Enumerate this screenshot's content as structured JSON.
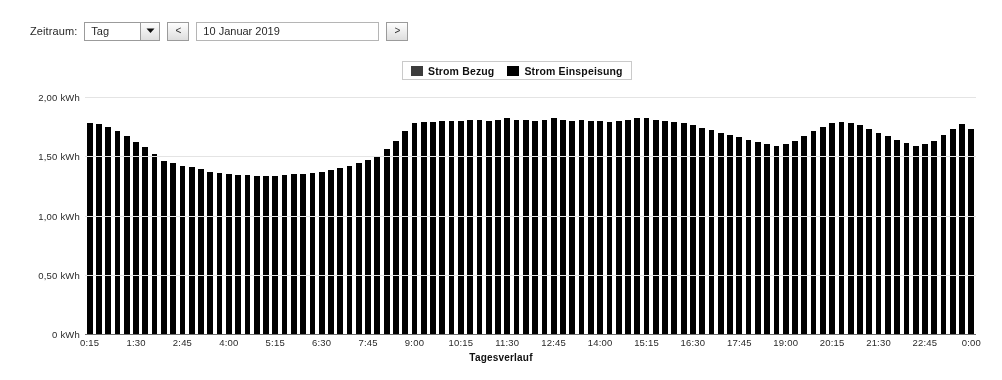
{
  "toolbar": {
    "label": "Zeitraum:",
    "period_select": {
      "value": "Tag",
      "options": [
        "Tag",
        "Woche",
        "Monat",
        "Jahr"
      ],
      "icon": "chevron-down-icon"
    },
    "prev_button": {
      "label": "<",
      "icon": "chevron-left-icon"
    },
    "date_field": {
      "value": "10 Januar 2019",
      "placeholder": ""
    },
    "next_button": {
      "label": ">",
      "icon": "chevron-right-icon"
    }
  },
  "legend": {
    "entries": [
      {
        "label": "Strom Bezug",
        "color": "#3d3d3d"
      },
      {
        "label": "Strom Einspeisung",
        "color": "#000000"
      }
    ]
  },
  "chart_data": {
    "type": "bar",
    "title": "",
    "xlabel": "Tagesverlauf",
    "ylabel": "",
    "ylim": [
      0,
      2.0
    ],
    "grid": true,
    "legend_position": "top-center",
    "ytick_labels": [
      "2,00 kWh",
      "1,50 kWh",
      "1,00 kWh",
      "0,50 kWh",
      "0 kWh"
    ],
    "ytick_values": [
      2.0,
      1.5,
      1.0,
      0.5,
      0
    ],
    "xtick_labels": [
      "0:15",
      "1:30",
      "2:45",
      "4:00",
      "5:15",
      "6:30",
      "7:45",
      "9:00",
      "10:15",
      "11:30",
      "12:45",
      "14:00",
      "15:15",
      "16:30",
      "17:45",
      "19:00",
      "20:15",
      "21:30",
      "22:45",
      "0:00"
    ],
    "xtick_indices": [
      0,
      5,
      10,
      15,
      20,
      25,
      30,
      35,
      40,
      45,
      50,
      55,
      60,
      65,
      70,
      75,
      80,
      85,
      90,
      95
    ],
    "categories": [
      "0:15",
      "0:30",
      "0:45",
      "1:00",
      "1:15",
      "1:30",
      "1:45",
      "2:00",
      "2:15",
      "2:30",
      "2:45",
      "3:00",
      "3:15",
      "3:30",
      "3:45",
      "4:00",
      "4:15",
      "4:30",
      "4:45",
      "5:00",
      "5:15",
      "5:30",
      "5:45",
      "6:00",
      "6:15",
      "6:30",
      "6:45",
      "7:00",
      "7:15",
      "7:30",
      "7:45",
      "8:00",
      "8:15",
      "8:30",
      "8:45",
      "9:00",
      "9:15",
      "9:30",
      "9:45",
      "10:00",
      "10:15",
      "10:30",
      "10:45",
      "11:00",
      "11:15",
      "11:30",
      "11:45",
      "12:00",
      "12:15",
      "12:30",
      "12:45",
      "13:00",
      "13:15",
      "13:30",
      "13:45",
      "14:00",
      "14:15",
      "14:30",
      "14:45",
      "15:00",
      "15:15",
      "15:30",
      "15:45",
      "16:00",
      "16:15",
      "16:30",
      "16:45",
      "17:00",
      "17:15",
      "17:30",
      "17:45",
      "18:00",
      "18:15",
      "18:30",
      "18:45",
      "19:00",
      "19:15",
      "19:30",
      "19:45",
      "20:00",
      "20:15",
      "20:30",
      "20:45",
      "21:00",
      "21:15",
      "21:30",
      "21:45",
      "22:00",
      "22:15",
      "22:30",
      "22:45",
      "23:00",
      "23:15",
      "23:30",
      "23:45",
      "0:00"
    ],
    "series": [
      {
        "name": "Strom Einspeisung",
        "color": "#000000",
        "values": [
          1.78,
          1.77,
          1.75,
          1.71,
          1.67,
          1.62,
          1.58,
          1.52,
          1.46,
          1.44,
          1.42,
          1.41,
          1.39,
          1.37,
          1.36,
          1.35,
          1.34,
          1.34,
          1.33,
          1.33,
          1.33,
          1.34,
          1.35,
          1.35,
          1.36,
          1.37,
          1.38,
          1.4,
          1.42,
          1.44,
          1.47,
          1.5,
          1.56,
          1.63,
          1.71,
          1.78,
          1.79,
          1.79,
          1.8,
          1.8,
          1.8,
          1.81,
          1.81,
          1.8,
          1.81,
          1.82,
          1.81,
          1.81,
          1.8,
          1.81,
          1.82,
          1.81,
          1.8,
          1.81,
          1.8,
          1.8,
          1.79,
          1.8,
          1.81,
          1.82,
          1.82,
          1.81,
          1.8,
          1.79,
          1.78,
          1.76,
          1.74,
          1.72,
          1.7,
          1.68,
          1.66,
          1.64,
          1.62,
          1.6,
          1.59,
          1.6,
          1.63,
          1.67,
          1.71,
          1.75,
          1.78,
          1.79,
          1.78,
          1.76,
          1.73,
          1.7,
          1.67,
          1.64,
          1.61,
          1.59,
          1.6,
          1.63,
          1.68,
          1.73,
          1.77,
          1.73
        ]
      }
    ]
  }
}
